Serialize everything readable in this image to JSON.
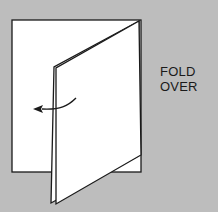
{
  "diagram": {
    "caption_lines": [
      "FOLD",
      "OVER"
    ],
    "colors": {
      "background": "#bdbdbd",
      "paper": "#ffffff",
      "stroke": "#1a1a1a"
    },
    "shapes": {
      "back_page": "12,20 141,20 141,172 12,172",
      "inner_page": "51,203 54,67 139,21 138,156",
      "front_flap": "56,68 139,21 141,155 56,204"
    },
    "arrow": {
      "direction": "left",
      "meaning": "fold-direction"
    }
  }
}
